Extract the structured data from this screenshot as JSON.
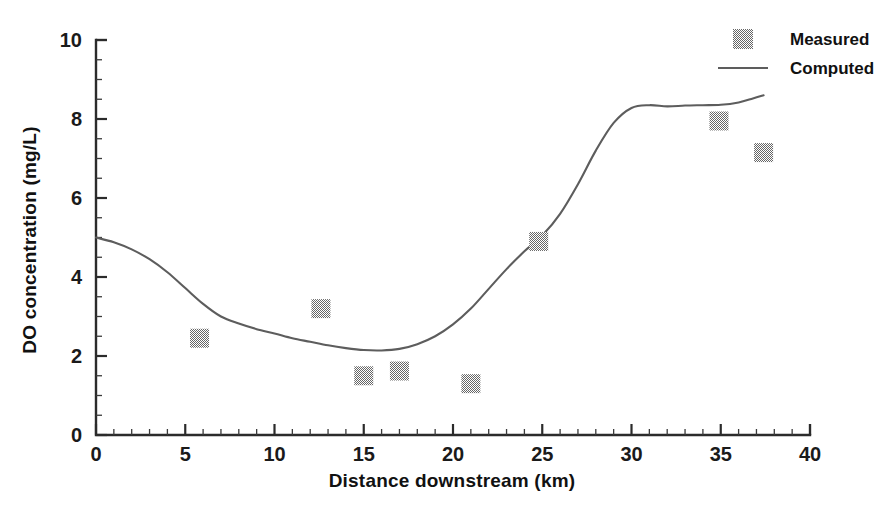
{
  "chart_data": {
    "type": "scatter",
    "title": "",
    "xlabel": "Distance downstream (km)",
    "ylabel": "DO concentration (mg/L)",
    "xlim": [
      0,
      40
    ],
    "ylim": [
      0,
      10
    ],
    "x_major_ticks": [
      0,
      5,
      10,
      15,
      20,
      25,
      30,
      35,
      40
    ],
    "y_major_ticks": [
      0,
      2,
      4,
      6,
      8,
      10
    ],
    "x_minor_tick_step": 1,
    "y_minor_tick_step": 0.5,
    "grid": false,
    "legend_position": "top-right",
    "series": [
      {
        "name": "Measured",
        "type": "scatter",
        "marker": "filled-square-hatched",
        "color": "#7a7a7a",
        "points": [
          {
            "x": 5.8,
            "y": 2.45
          },
          {
            "x": 12.6,
            "y": 3.2
          },
          {
            "x": 15.0,
            "y": 1.5
          },
          {
            "x": 17.0,
            "y": 1.62
          },
          {
            "x": 21.0,
            "y": 1.3
          },
          {
            "x": 24.8,
            "y": 4.9
          },
          {
            "x": 34.9,
            "y": 7.95
          },
          {
            "x": 37.4,
            "y": 7.15
          }
        ]
      },
      {
        "name": "Computed",
        "type": "line",
        "color": "#5d5d5d",
        "points": [
          {
            "x": 0.0,
            "y": 5.0
          },
          {
            "x": 1.0,
            "y": 4.88
          },
          {
            "x": 2.0,
            "y": 4.7
          },
          {
            "x": 3.0,
            "y": 4.45
          },
          {
            "x": 4.0,
            "y": 4.12
          },
          {
            "x": 5.0,
            "y": 3.72
          },
          {
            "x": 6.0,
            "y": 3.32
          },
          {
            "x": 7.0,
            "y": 3.0
          },
          {
            "x": 8.0,
            "y": 2.82
          },
          {
            "x": 9.0,
            "y": 2.68
          },
          {
            "x": 10.0,
            "y": 2.57
          },
          {
            "x": 11.0,
            "y": 2.45
          },
          {
            "x": 12.0,
            "y": 2.36
          },
          {
            "x": 13.0,
            "y": 2.27
          },
          {
            "x": 14.0,
            "y": 2.2
          },
          {
            "x": 15.0,
            "y": 2.15
          },
          {
            "x": 16.0,
            "y": 2.14
          },
          {
            "x": 17.0,
            "y": 2.18
          },
          {
            "x": 18.0,
            "y": 2.3
          },
          {
            "x": 19.0,
            "y": 2.5
          },
          {
            "x": 20.0,
            "y": 2.8
          },
          {
            "x": 21.0,
            "y": 3.2
          },
          {
            "x": 22.0,
            "y": 3.7
          },
          {
            "x": 23.0,
            "y": 4.2
          },
          {
            "x": 24.0,
            "y": 4.65
          },
          {
            "x": 25.0,
            "y": 5.05
          },
          {
            "x": 26.0,
            "y": 5.6
          },
          {
            "x": 27.0,
            "y": 6.35
          },
          {
            "x": 28.0,
            "y": 7.2
          },
          {
            "x": 29.0,
            "y": 7.9
          },
          {
            "x": 30.0,
            "y": 8.28
          },
          {
            "x": 31.0,
            "y": 8.35
          },
          {
            "x": 32.0,
            "y": 8.32
          },
          {
            "x": 33.0,
            "y": 8.34
          },
          {
            "x": 34.0,
            "y": 8.35
          },
          {
            "x": 35.0,
            "y": 8.36
          },
          {
            "x": 36.0,
            "y": 8.42
          },
          {
            "x": 36.8,
            "y": 8.52
          },
          {
            "x": 37.4,
            "y": 8.6
          }
        ]
      }
    ],
    "legend": [
      {
        "label": "Measured",
        "marker": "filled-square-hatched"
      },
      {
        "label": "Computed",
        "marker": "line"
      }
    ]
  }
}
